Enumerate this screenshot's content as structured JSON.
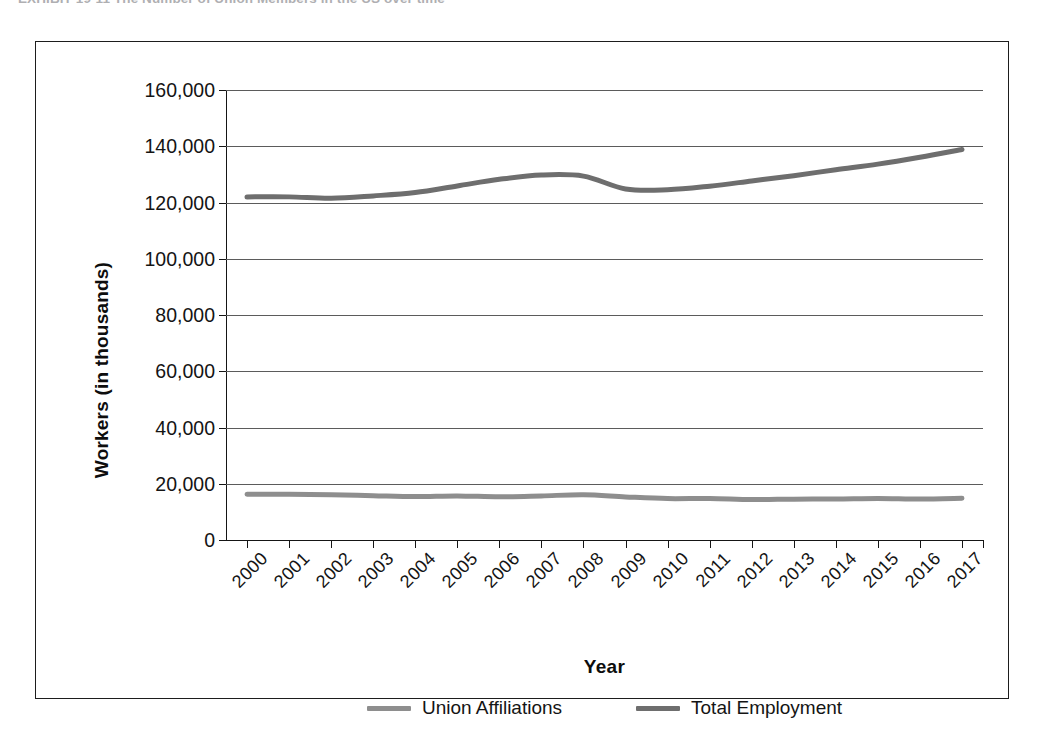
{
  "caption": {
    "text": "EXHIBIT 19-11  The Number of Union Members in the US over time"
  },
  "chart_data": {
    "type": "line",
    "title": "",
    "xlabel": "Year",
    "ylabel": "Workers (in thousands)",
    "x": [
      2000,
      2001,
      2002,
      2003,
      2004,
      2005,
      2006,
      2007,
      2008,
      2009,
      2010,
      2011,
      2012,
      2013,
      2014,
      2015,
      2016,
      2017
    ],
    "categories": [
      "2000",
      "2001",
      "2002",
      "2003",
      "2004",
      "2005",
      "2006",
      "2007",
      "2008",
      "2009",
      "2010",
      "2011",
      "2012",
      "2013",
      "2014",
      "2015",
      "2016",
      "2017"
    ],
    "series": [
      {
        "name": "Union Affiliations",
        "color": "#8e8e8e",
        "values": [
          16258,
          16275,
          16107,
          15776,
          15472,
          15685,
          15359,
          15670,
          16098,
          15327,
          14715,
          14764,
          14366,
          14528,
          14576,
          14795,
          14576,
          14817
        ]
      },
      {
        "name": "Total Employment",
        "color": "#6e6e6e",
        "values": [
          122000,
          122000,
          121500,
          122350,
          123554,
          125890,
          128232,
          129767,
          129377,
          124817,
          124530,
          125810,
          127650,
          129530,
          131650,
          133650,
          136100,
          138850
        ]
      }
    ],
    "ylim": [
      0,
      160000
    ],
    "ytick_values": [
      0,
      20000,
      40000,
      60000,
      80000,
      100000,
      120000,
      140000,
      160000
    ],
    "ytick_labels": [
      "0",
      "20,000",
      "40,000",
      "60,000",
      "80,000",
      "100,000",
      "120,000",
      "140,000",
      "160,000"
    ],
    "grid": true,
    "legend_position": "bottom",
    "axis_color": "#151515",
    "gridline_color": "#5b5b5b",
    "background": "#ffffff"
  }
}
